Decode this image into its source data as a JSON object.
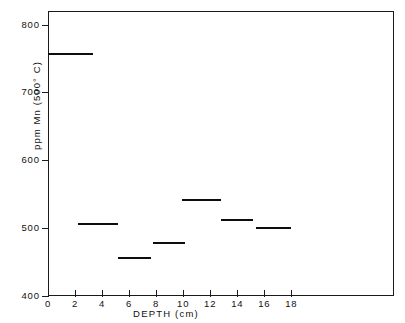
{
  "chart_data": {
    "type": "bar",
    "title": "",
    "subtitle": "",
    "xlabel": "DEPTH  (cm)",
    "ylabel": "ppm Mn  (500° C)",
    "xlim": [
      0,
      25.6
    ],
    "ylim": [
      400,
      820
    ],
    "grid": false,
    "legend": null,
    "xticks": [
      0,
      2,
      4,
      6,
      8,
      10,
      12,
      14,
      16,
      18
    ],
    "xtick_labels": [
      "0",
      "2",
      "4",
      "6",
      "8",
      "10",
      "12",
      "14",
      "16",
      "18"
    ],
    "yticks": [
      400,
      500,
      600,
      700,
      800
    ],
    "ytick_labels": [
      "400",
      "500",
      "600",
      "700",
      "800"
    ],
    "style": "horizontal-level-segments",
    "categories": [
      "0-3.3",
      "2.2-5.2",
      "5.2-7.6",
      "7.8-10.1",
      "9.9-12.8",
      "12.8-15.2",
      "15.4-18.0"
    ],
    "values": [
      758,
      507,
      457,
      480,
      543,
      514,
      501
    ],
    "segments": [
      {
        "x_start": 0.0,
        "x_end": 3.3,
        "value": 758
      },
      {
        "x_start": 2.2,
        "x_end": 5.2,
        "value": 507
      },
      {
        "x_start": 5.2,
        "x_end": 7.6,
        "value": 457
      },
      {
        "x_start": 7.8,
        "x_end": 10.1,
        "value": 480
      },
      {
        "x_start": 9.9,
        "x_end": 12.8,
        "value": 543
      },
      {
        "x_start": 12.8,
        "x_end": 15.2,
        "value": 514
      },
      {
        "x_start": 15.4,
        "x_end": 18.0,
        "value": 501
      }
    ]
  },
  "axes": {
    "x_title": "DEPTH  (cm)",
    "y_title": "ppm Mn  (500° C)"
  },
  "colors": {
    "line": "#0d0d0d",
    "frame": "#1b1b1b",
    "background": "#ffffff"
  }
}
